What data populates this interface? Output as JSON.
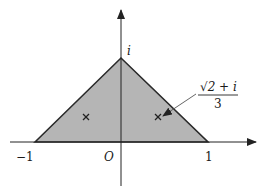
{
  "diagram": {
    "type": "complex-plane-region",
    "region": {
      "shape": "triangle",
      "vertices": [
        "-1",
        "1",
        "i"
      ],
      "fill": "#b5b5b5",
      "stroke": "#2a2a2a"
    },
    "axes": {
      "origin_label": "O",
      "x_ticks": [
        "−1",
        "1"
      ],
      "y_ticks": [
        "i"
      ]
    },
    "points": [
      {
        "name": "left-centroid-mark",
        "symbol": "×"
      },
      {
        "name": "right-centroid-mark",
        "symbol": "×"
      }
    ],
    "annotation": {
      "numerator": "√2 + i",
      "denominator": "3"
    }
  }
}
